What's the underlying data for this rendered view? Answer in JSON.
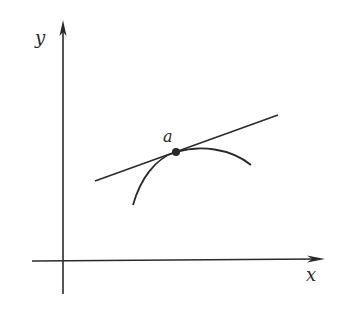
{
  "diagram": {
    "type": "tangent-line-to-curve",
    "colors": {
      "ink": "#2a2a2a",
      "background": "#ffffff"
    },
    "axes": {
      "x_label": "x",
      "y_label": "y"
    },
    "point": {
      "label": "a"
    },
    "elements": [
      "x-axis",
      "y-axis",
      "curve",
      "tangent-line",
      "point-a"
    ]
  }
}
